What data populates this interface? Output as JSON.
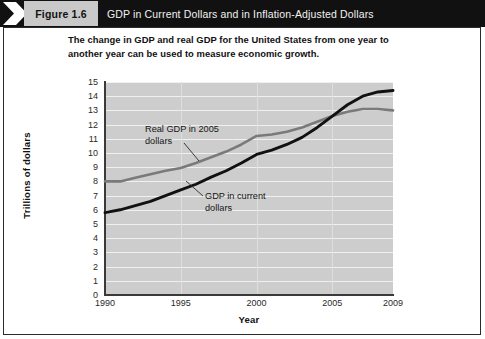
{
  "header": {
    "chevron_icon": "chevron-right-icon",
    "figure_label": "Figure 1.6",
    "title": "GDP in Current Dollars and in Inflation-Adjusted Dollars"
  },
  "subtitle": {
    "line1": "The change in GDP and real GDP for the United States from one year to",
    "line2": "another year can be used to measure economic growth."
  },
  "colors": {
    "header_bg": "#111111",
    "figure_label_bg": "#c9c9c9",
    "plot_bg": "#cdcdcd",
    "gridline": "#f0f0f0",
    "series_real_gdp": "#7a7a7a",
    "series_current_gdp": "#111111"
  },
  "chart_data": {
    "type": "line",
    "title": "GDP in Current Dollars and in Inflation-Adjusted Dollars",
    "xlabel": "Year",
    "ylabel": "Trillions of dollars",
    "xlim": [
      1990,
      2009
    ],
    "ylim": [
      0,
      15
    ],
    "xticks": [
      "1990",
      "1995",
      "2000",
      "2005",
      "2009"
    ],
    "xtick_values": [
      1990,
      1995,
      2000,
      2005,
      2009
    ],
    "yticks": [
      "0",
      "1",
      "2",
      "3",
      "4",
      "5",
      "6",
      "7",
      "8",
      "9",
      "10",
      "11",
      "12",
      "13",
      "14",
      "15"
    ],
    "ytick_values": [
      0,
      1,
      2,
      3,
      4,
      5,
      6,
      7,
      8,
      9,
      10,
      11,
      12,
      13,
      14,
      15
    ],
    "grid": true,
    "legend": "annotations",
    "x": [
      1990,
      1991,
      1992,
      1993,
      1994,
      1995,
      1996,
      1997,
      1998,
      1999,
      2000,
      2001,
      2002,
      2003,
      2004,
      2005,
      2006,
      2007,
      2008,
      2009
    ],
    "series": [
      {
        "name": "Real GDP in 2005 dollars",
        "color": "#7a7a7a",
        "values": [
          8.0,
          8.0,
          8.25,
          8.5,
          8.75,
          8.95,
          9.3,
          9.7,
          10.1,
          10.6,
          11.2,
          11.3,
          11.5,
          11.8,
          12.2,
          12.6,
          12.9,
          13.1,
          13.1,
          13.0
        ]
      },
      {
        "name": "GDP in current dollars",
        "color": "#111111",
        "values": [
          5.8,
          6.0,
          6.3,
          6.6,
          7.0,
          7.4,
          7.8,
          8.3,
          8.75,
          9.3,
          9.9,
          10.2,
          10.6,
          11.1,
          11.8,
          12.6,
          13.4,
          14.0,
          14.3,
          14.4
        ]
      }
    ],
    "annotations": [
      {
        "name": "real-gdp-annotation",
        "line1": "Real GDP in 2005",
        "line2": "dollars"
      },
      {
        "name": "current-gdp-annotation",
        "line1": "GDP in current",
        "line2": "dollars"
      }
    ]
  }
}
